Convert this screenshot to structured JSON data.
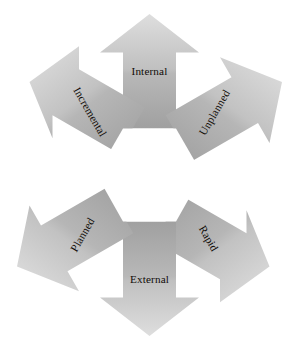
{
  "diagram": {
    "type": "radial-arrow-cycle",
    "shape": "hexagon",
    "arrow_count": 6,
    "center_fill": "#ffffff",
    "background": "#ffffff",
    "gradient": {
      "light": "#d8d8d8",
      "mid": "#b3b3b3",
      "dark": "#9a9a9a"
    },
    "label_color": "#100c08",
    "arrows": [
      {
        "id": "internal",
        "label": "Internal",
        "direction": "up",
        "angle_deg": 0,
        "label_rotation_deg": 0
      },
      {
        "id": "unplanned",
        "label": "Unplanned",
        "direction": "up-right",
        "angle_deg": 60,
        "label_rotation_deg": 60
      },
      {
        "id": "rapid",
        "label": "Rapid",
        "direction": "down-right",
        "angle_deg": 120,
        "label_rotation_deg": 120
      },
      {
        "id": "external",
        "label": "External",
        "direction": "down",
        "angle_deg": 180,
        "label_rotation_deg": 0
      },
      {
        "id": "planned",
        "label": "Planned",
        "direction": "down-left",
        "angle_deg": 240,
        "label_rotation_deg": 60
      },
      {
        "id": "incremental",
        "label": "Incremental",
        "direction": "up-left",
        "angle_deg": 300,
        "label_rotation_deg": 120
      }
    ]
  }
}
